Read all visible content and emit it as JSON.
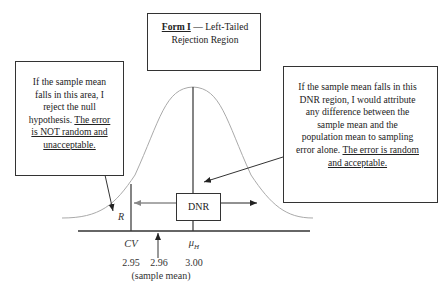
{
  "title_box": {
    "title_underlined": "Form I",
    "title_rest": " — Left-Tailed Rejection Region"
  },
  "left_callout": {
    "text": "If the sample mean falls in this area, I reject the null hypothesis.",
    "underlined": "The error is NOT random and unacceptable."
  },
  "right_callout": {
    "text": "If the sample mean falls in this DNR region, I would attribute any difference between the sample mean and the population mean to sampling error alone.",
    "underlined": "The error is random and acceptable."
  },
  "diagram": {
    "rejection_label": "R",
    "dnr_label": "DNR",
    "cv_label": "CV",
    "mu_label": "μ",
    "mu_subscript": "H",
    "cv_value": "2.95",
    "sample_mean_value": "2.96",
    "mu_value": "3.00",
    "sample_mean_caption": "(sample mean)"
  },
  "colors": {
    "curve": "#aaaaaa",
    "lines": "#333333"
  }
}
